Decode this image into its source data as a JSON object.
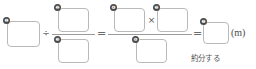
{
  "worksheet": {
    "type": "math-fraction-division-worksheet",
    "unit_label": "(m)",
    "annotation": "約分する",
    "operators": {
      "divide": "÷",
      "equals_1": "=",
      "equals_2": "=",
      "multiply": "×"
    },
    "markers": {
      "m1": "❶",
      "m2": "❷",
      "m3": "❸",
      "m4": "❹",
      "m5": "❺",
      "m6": "❻",
      "m7": "❼"
    },
    "blanks": {
      "dividend": "",
      "divisor_numerator": "",
      "divisor_denominator": "",
      "result_numerator_left": "",
      "result_numerator_right": "",
      "result_denominator": "",
      "final_answer": ""
    },
    "colors": {
      "box_border": "#b9b9b9",
      "marker_fill": "#4a4a4a",
      "marker_text": "#ffffff",
      "operator": "#6b6b6b",
      "rule": "#9a9a9a",
      "text": "#4a4a4a",
      "background": "#ffffff"
    }
  }
}
